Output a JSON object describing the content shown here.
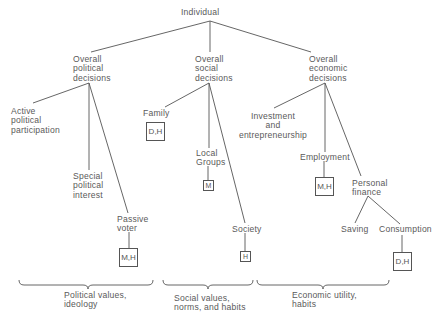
{
  "root": {
    "label": "Individual"
  },
  "branches": {
    "political": {
      "label": "Overall political decisions",
      "lines": [
        "Overall",
        "political",
        "decisions"
      ],
      "children": {
        "active": {
          "lines": [
            "Active",
            "political",
            "participation"
          ]
        },
        "special": {
          "lines": [
            "Special",
            "political",
            "interest"
          ]
        },
        "passive": {
          "lines": [
            "Passive",
            "voter"
          ],
          "tag": "M,H"
        }
      }
    },
    "social": {
      "label": "Overall social decisions",
      "lines": [
        "Overall",
        "social",
        "decisions"
      ],
      "children": {
        "family": {
          "label": "Family",
          "tag": "D,H"
        },
        "local": {
          "lines": [
            "Local",
            "Groups"
          ],
          "tag": "M"
        },
        "society": {
          "label": "Society",
          "tag": "H"
        }
      }
    },
    "economic": {
      "label": "Overall economic decisions",
      "lines": [
        "Overall",
        "economic",
        "decisions"
      ],
      "children": {
        "investment": {
          "lines": [
            "Investment",
            "and",
            "entrepreneurship"
          ]
        },
        "employment": {
          "label": "Employment",
          "tag": "M,H"
        },
        "personal": {
          "lines": [
            "Personal",
            "finance"
          ],
          "children": {
            "saving": {
              "label": "Saving"
            },
            "consumption": {
              "label": "Consumption",
              "tag": "D,H"
            }
          }
        }
      }
    }
  },
  "groups": [
    {
      "lines": [
        "Political values,",
        "ideology"
      ]
    },
    {
      "lines": [
        "Social values,",
        "norms, and habits"
      ]
    },
    {
      "lines": [
        "Economic utility,",
        "habits"
      ]
    }
  ],
  "colors": {
    "line": "#555555",
    "text": "#5a5a5a",
    "background": "#ffffff"
  }
}
